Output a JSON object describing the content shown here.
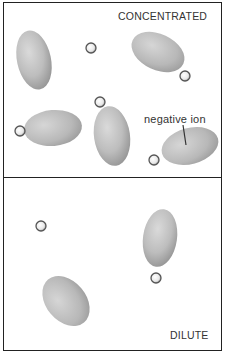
{
  "panels": {
    "top": {
      "label": "CONCENTRATED"
    },
    "bottom": {
      "label": "DILUTE"
    }
  },
  "annotation": {
    "label": "negative ion"
  },
  "colors": {
    "border": "#222222",
    "ellipse_light": "#d4d4d4",
    "ellipse_dark": "#8a8a8a",
    "positive_ion_ring": "#555555"
  }
}
